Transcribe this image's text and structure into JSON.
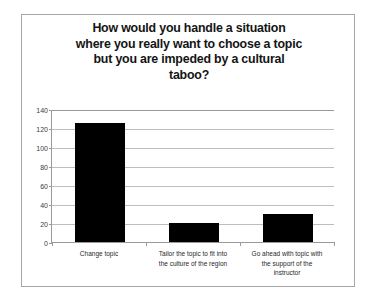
{
  "chart_data": {
    "type": "bar",
    "title": "How would you handle a situation where you really want to choose a topic but you are impeded by a cultural taboo?",
    "title_lines": [
      "How would you handle a situation",
      "where you really want to choose a topic",
      "but you are impeded by a cultural",
      "taboo?"
    ],
    "categories": [
      "Change topic",
      "Tailor the topic to fit into the culture of the region",
      "Go ahead with topic with the support of the instructor"
    ],
    "category_lines": [
      [
        "Change topic"
      ],
      [
        "Tailor the topic to fit into",
        "the culture of the region"
      ],
      [
        "Go ahead with topic with",
        "the support of the",
        "instructor"
      ]
    ],
    "values": [
      125,
      20,
      30
    ],
    "xlabel": "",
    "ylabel": "",
    "ylim": [
      0,
      140
    ],
    "ytick_values": [
      0,
      20,
      40,
      60,
      80,
      100,
      120,
      140
    ],
    "ytick_labels": [
      "0",
      "20",
      "40",
      "60",
      "80",
      "100",
      "120",
      "140"
    ],
    "grid": true,
    "legend": false,
    "bar_color": "#000000",
    "grid_color": "#bdbdbd",
    "axis_color": "#9a9a9a",
    "border_color": "#a6a6a6",
    "background": "#ffffff"
  }
}
